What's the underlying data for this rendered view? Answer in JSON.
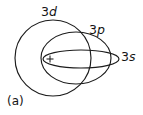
{
  "figure": {
    "caption": "(a)",
    "background_color": "#ffffff",
    "stroke_color": "#1c1c1c",
    "width": 143,
    "height": 115,
    "nucleus": {
      "symbol": "+",
      "x": 50,
      "y": 59
    },
    "orbits": [
      {
        "id": "3d",
        "shape": "circle",
        "principal": "3",
        "subshell": "d",
        "label": "3d",
        "label_x": 41,
        "label_y": 6,
        "cx": 53,
        "cy": 58,
        "rx": 38,
        "ry": 38,
        "rotation": 0
      },
      {
        "id": "3p",
        "shape": "ellipse",
        "principal": "3",
        "subshell": "p",
        "label": "3p",
        "label_x": 89,
        "label_y": 24,
        "cx": 76,
        "cy": 58,
        "rx": 35,
        "ry": 26,
        "rotation": 0
      },
      {
        "id": "3s",
        "shape": "ellipse",
        "principal": "3",
        "subshell": "s",
        "label": "3s",
        "label_x": 121,
        "label_y": 51,
        "cx": 81,
        "cy": 59,
        "rx": 38,
        "ry": 9,
        "rotation": 0
      }
    ]
  }
}
